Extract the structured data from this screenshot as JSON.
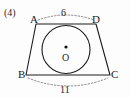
{
  "figure": {
    "item_number": "(4)",
    "shape": "trapezoid-with-inscribed-circle",
    "vertices": [
      {
        "name": "A",
        "label": "A",
        "x": 36,
        "y": 24
      },
      {
        "name": "D",
        "label": "D",
        "x": 96,
        "y": 24
      },
      {
        "name": "B",
        "label": "B",
        "x": 26,
        "y": 75
      },
      {
        "name": "C",
        "label": "C",
        "x": 110,
        "y": 75
      }
    ],
    "circle": {
      "center_label": "O",
      "center_x": 66,
      "center_y": 49,
      "radius": 24,
      "center_dot": true
    },
    "measures": [
      {
        "name": "top-side",
        "segment": "AD",
        "value": "6",
        "style": "dashed-arc",
        "position": "above"
      },
      {
        "name": "bottom-side",
        "segment": "BC",
        "value": "11",
        "style": "dashed-arc",
        "position": "below"
      }
    ],
    "colors": {
      "stroke": "#1c1c1c",
      "dashed_stroke": "#6f6f6f",
      "background": "#fdfdfd",
      "text": "#1c1c1c"
    }
  }
}
